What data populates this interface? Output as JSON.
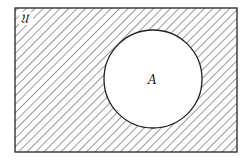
{
  "diagram": {
    "type": "venn",
    "universe_label": "𝔘",
    "universe_text": "U",
    "set_label": "A",
    "shaded_region": "complement of A",
    "colors": {
      "line": "#222222",
      "hatch": "#555555",
      "background": "#ffffff"
    }
  }
}
